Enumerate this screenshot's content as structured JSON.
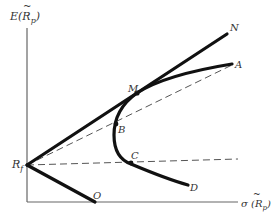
{
  "diagram": {
    "type": "capital market line / efficient frontier diagram",
    "y_axis_label": "E(R̃p)",
    "y_axis_label_main": "E(",
    "y_axis_label_var": "R",
    "y_axis_label_sub": "p",
    "y_axis_label_close": ")",
    "x_axis_label_main": "σ (",
    "x_axis_label_var": "R",
    "x_axis_label_sub": "p",
    "x_axis_label_close": ")",
    "points": {
      "Rf": {
        "label": "R",
        "sub": "f"
      },
      "N": {
        "label": "N"
      },
      "A": {
        "label": "A"
      },
      "M": {
        "label": "M"
      },
      "B": {
        "label": "B"
      },
      "C": {
        "label": "C"
      },
      "D": {
        "label": "D"
      },
      "O": {
        "label": "O"
      }
    },
    "lines": [
      {
        "name": "Rf-N",
        "style": "solid-thick",
        "description": "capital market line tangent at M"
      },
      {
        "name": "Rf-O",
        "style": "solid-thick",
        "description": "line to O on horizontal axis"
      },
      {
        "name": "frontier A-M-B-C-D",
        "style": "solid-thick-curve",
        "description": "risky asset frontier"
      },
      {
        "name": "Rf-B-A",
        "style": "dashed"
      },
      {
        "name": "Rf-C",
        "style": "dashed",
        "description": "horizontal dashed line from Rf"
      }
    ],
    "colors": {
      "ink": "#111111",
      "axis": "#666666",
      "dash": "#555555"
    }
  }
}
